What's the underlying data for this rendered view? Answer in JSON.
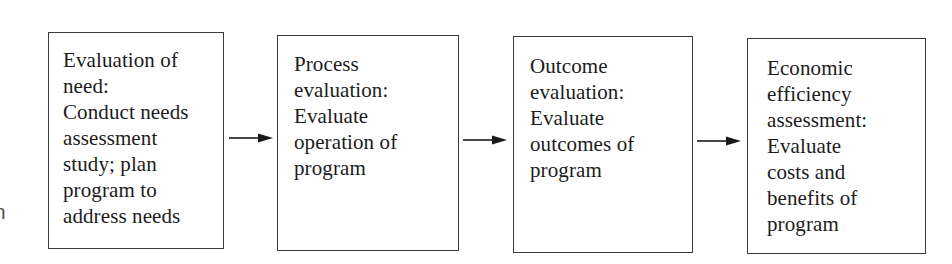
{
  "diagram": {
    "type": "flowchart",
    "direction": "left-to-right",
    "boxes": [
      {
        "id": "evaluation-of-need",
        "title": "Evaluation of need:",
        "text": "Evaluation of\nneed:\nConduct needs\nassessment\nstudy; plan\nprogram to\naddress needs"
      },
      {
        "id": "process-evaluation",
        "title": "Process evaluation:",
        "text": "Process\nevaluation:\nEvaluate\noperation of\nprogram"
      },
      {
        "id": "outcome-evaluation",
        "title": "Outcome evaluation:",
        "text": "Outcome\nevaluation:\nEvaluate\noutcomes of\nprogram"
      },
      {
        "id": "economic-efficiency-assessment",
        "title": "Economic efficiency assessment:",
        "text": "Economic\nefficiency\nassessment:\nEvaluate\ncosts and\nbenefits of\nprogram"
      }
    ],
    "arrows": [
      {
        "from": "evaluation-of-need",
        "to": "process-evaluation"
      },
      {
        "from": "process-evaluation",
        "to": "outcome-evaluation"
      },
      {
        "from": "outcome-evaluation",
        "to": "economic-efficiency-assessment"
      }
    ],
    "edge_fragments": [
      "f",
      "n"
    ]
  }
}
